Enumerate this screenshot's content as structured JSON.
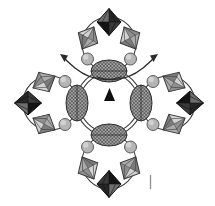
{
  "figure": {
    "kind": "crystal-structure-diagram",
    "canvas": {
      "width": 215,
      "height": 206,
      "background": "#ffffff"
    },
    "center": {
      "x": 109,
      "y": 103
    },
    "central_rings": {
      "radii": [
        33,
        29.5
      ],
      "stroke": "#3d3d3d",
      "stroke_width": 1.1
    },
    "arm_angles_deg": [
      -90,
      0,
      90,
      180
    ],
    "arm_layout": {
      "ring": {
        "dist": 59,
        "r": 27,
        "stroke": "#3d3d3d",
        "stroke_width": 1.1
      },
      "dark_octahedron": {
        "dist": 81,
        "rx": 12,
        "ry": 13.5
      },
      "medium_octahedra": {
        "dist": 65,
        "side": 21,
        "rx": 11,
        "ry": 12.5,
        "tilt_deg": 28
      },
      "spheres": {
        "dist": 44,
        "side": 21.5,
        "r": 6
      },
      "ellipse": {
        "dist": 32,
        "rx": 18,
        "ry": 11
      }
    },
    "palette": {
      "dark_octahedron": {
        "facets": [
          "#6e6e6e",
          "#262626",
          "#3a3a3a",
          "#151515"
        ],
        "edge": "#0f0f0f"
      },
      "medium_octahedron": {
        "facets": [
          "#d2d2d2",
          "#8f8f8f",
          "#ababab",
          "#7c7c7c"
        ],
        "edge": "#3c3c3c"
      },
      "sphere": {
        "fill": "#b5b5b5",
        "highlight": "#dcdcdc",
        "edge": "#4d4d4d"
      },
      "ellipse": {
        "fill": "#a3a3a3",
        "hatch": "#383838",
        "edge": "#2e2e2e"
      },
      "arrow": "#2b2b2b",
      "triangle": "#101010",
      "tick": "#8f8f8f"
    },
    "rotation_arrows": [
      {
        "path": "M 121 77 Q 96 85 75 68 Q 68 62 64 58",
        "head": "60,54 68,55.5 64.5,62"
      },
      {
        "path": "M 97 77 Q 122 85 143 68 Q 150 62 154 58",
        "head": "158,54 150,55.5 153.5,62"
      }
    ],
    "center_triangle": {
      "points": "109.5,88 104,101 115,101"
    },
    "scale_tick": {
      "x": 150.5,
      "y1": 175,
      "y2": 189,
      "width": 1.3
    }
  }
}
